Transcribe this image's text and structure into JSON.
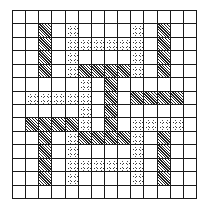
{
  "diagram": {
    "type": "grid-pattern",
    "rows": 14,
    "columns": 14,
    "legend": {
      "H": "hatched",
      "D": "dotted",
      ".": "empty"
    },
    "colors": {
      "line": "#1a1a1a",
      "background": "#ffffff",
      "hatch": "#222222",
      "dot": "#444444"
    },
    "cells": [
      "..............",
      "..H.D....D.H..",
      "..H.DDDDDD.H..",
      "..H.D....D.H..",
      "..H.DHHHHD.H..",
      ".....D.H......",
      ".DDDDD.H.HHHH.",
      ".....D.H......",
      ".HHHHD.H.DDDD.",
      "..H.DHHHHD.H..",
      "..H.D....D.H..",
      "..H.DDDDDD.H..",
      "..H.D....D.H..",
      ".............."
    ]
  }
}
